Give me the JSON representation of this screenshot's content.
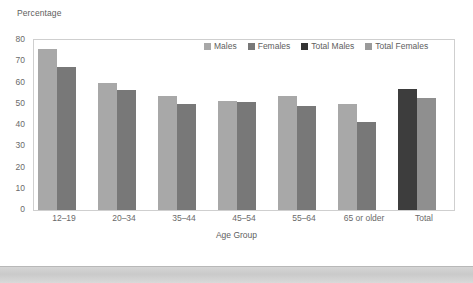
{
  "chart_data": {
    "type": "bar",
    "title": "",
    "xlabel": "Age Group",
    "ylabel": "Percentage",
    "ylim": [
      0,
      80
    ],
    "ytick_labels": [
      "80",
      "70",
      "60",
      "50",
      "40",
      "30",
      "20",
      "10",
      "0"
    ],
    "ytick_values": [
      80,
      70,
      60,
      50,
      40,
      30,
      20,
      10,
      0
    ],
    "grid": false,
    "legend_position": "top-right-inside",
    "categories": [
      "12–19",
      "20–34",
      "35–44",
      "45–54",
      "55–64",
      "65 or older",
      "Total"
    ],
    "series": [
      {
        "name": "Males",
        "color": "#a8a8a8",
        "values": [
          76,
          60,
          53.5,
          51.5,
          53.5,
          50,
          null
        ]
      },
      {
        "name": "Females",
        "color": "#787878",
        "values": [
          67.5,
          56.5,
          50,
          51,
          49,
          41.5,
          null
        ]
      },
      {
        "name": "Total Males",
        "color": "#3d3d3d",
        "values": [
          null,
          null,
          null,
          null,
          null,
          null,
          57
        ]
      },
      {
        "name": "Total Females",
        "color": "#8f8f8f",
        "values": [
          null,
          null,
          null,
          null,
          null,
          null,
          52.5
        ]
      }
    ],
    "legend": [
      {
        "label": "Males",
        "color": "#a8a8a8"
      },
      {
        "label": "Females",
        "color": "#787878"
      },
      {
        "label": "Total Males",
        "color": "#333333"
      },
      {
        "label": "Total Females",
        "color": "#9a9a9a"
      }
    ]
  }
}
